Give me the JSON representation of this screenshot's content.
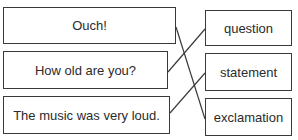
{
  "left_items": [
    {
      "label": "Ouch!"
    },
    {
      "label": "How old are you?"
    },
    {
      "label": "The music was very loud."
    }
  ],
  "right_items": [
    {
      "label": "question"
    },
    {
      "label": "statement"
    },
    {
      "label": "exclamation"
    }
  ],
  "matches": [
    {
      "left": "Ouch!",
      "right": "exclamation"
    },
    {
      "left": "How old are you?",
      "right": "question"
    },
    {
      "left": "The music was very loud.",
      "right": "statement"
    }
  ]
}
